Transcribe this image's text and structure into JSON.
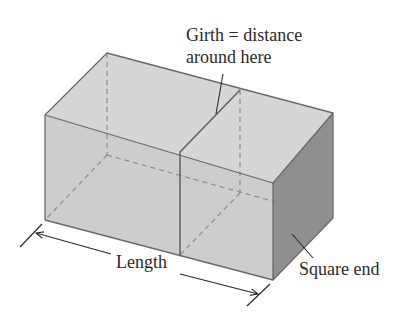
{
  "figure": {
    "type": "3d-box-diagram",
    "colors": {
      "face_top": "#d4d4d4",
      "face_front": "#cfcfcf",
      "face_end": "#8f8f8f",
      "edge": "#6a6a6a",
      "hidden_edge": "#8a8a8a",
      "text": "#2a2a2a",
      "background": "#ffffff"
    }
  },
  "labels": {
    "girth_line1": "Girth = distance",
    "girth_line2": "around here",
    "length": "Length",
    "square_end": "Square end"
  }
}
